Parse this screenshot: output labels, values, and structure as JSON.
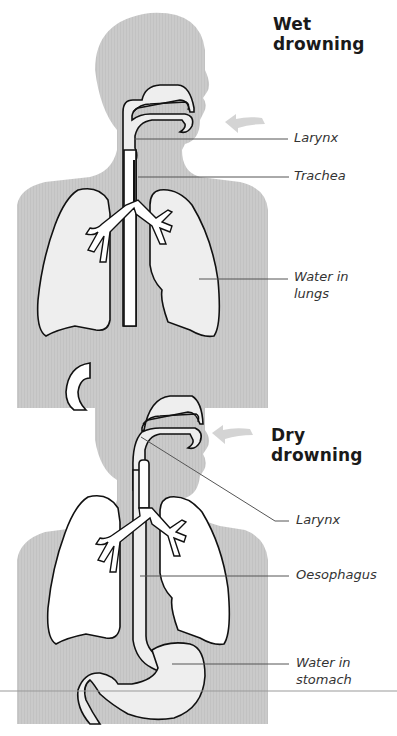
{
  "diagram": {
    "colors": {
      "body_fill": "#c9c9c9",
      "organ_fill_wet_lungs": "#eeeeee",
      "organ_fill_white": "#ffffff",
      "stomach_fill": "#eeeeee",
      "outline": "#111111",
      "leader_line": "#555555",
      "arrow": "#d4d4d4"
    },
    "panels": [
      {
        "id": "wet",
        "title_line1": "Wet",
        "title_line2": "drowning",
        "labels": [
          {
            "text": "Larynx"
          },
          {
            "text": "Trachea"
          },
          {
            "text_line1": "Water in",
            "text_line2": "lungs"
          }
        ]
      },
      {
        "id": "dry",
        "title_line1": "Dry",
        "title_line2": "drowning",
        "labels": [
          {
            "text": "Larynx"
          },
          {
            "text": "Oesophagus"
          },
          {
            "text_line1": "Water in",
            "text_line2": "stomach"
          }
        ]
      }
    ]
  }
}
